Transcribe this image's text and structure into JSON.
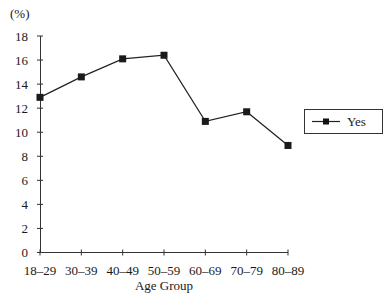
{
  "chart_data": {
    "type": "line",
    "title": "",
    "xlabel": "Age Group",
    "ylabel": "(%)",
    "categories": [
      "18–29",
      "30–39",
      "40–49",
      "50–59",
      "60–69",
      "70–79",
      "80–89"
    ],
    "series": [
      {
        "name": "Yes",
        "values": [
          12.9,
          14.6,
          16.1,
          16.4,
          10.9,
          11.7,
          8.9
        ],
        "marker": "square",
        "color": "#1a1a1a"
      }
    ],
    "ylim": [
      0,
      18
    ],
    "yticks": [
      0,
      2,
      4,
      6,
      8,
      10,
      12,
      14,
      16,
      18
    ],
    "grid": false,
    "legend_position": "right"
  }
}
